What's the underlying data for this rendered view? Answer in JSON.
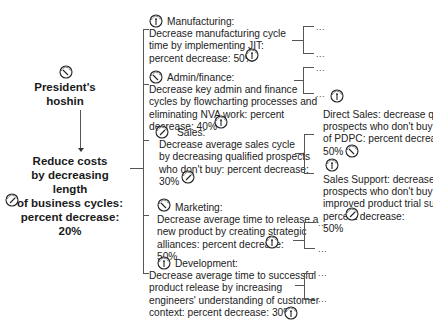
{
  "root": {
    "title": "President's hoshin",
    "title_line1": "President's",
    "title_line2": "hoshin",
    "goal_lines": [
      "Reduce costs",
      "by decreasing length",
      "of business cycles:",
      "percent decrease:",
      "20%"
    ]
  },
  "departments": [
    {
      "name": "Manufacturing:",
      "lines": [
        "Decrease manufacturing cycle",
        "time by implementing JIT:",
        "percent decrease: 50%"
      ]
    },
    {
      "name": "Admin/finance:",
      "lines": [
        "Decrease key admin and finance",
        "cycles by flowcharting processes and",
        "eliminating NVA work: percent",
        "decrease: 40%"
      ]
    },
    {
      "name": "Sales:",
      "lines": [
        "Decrease average sales cycle",
        "by decreasing qualified prospects",
        "who don't buy: percent decrease:",
        "30%"
      ]
    },
    {
      "name": "Marketing:",
      "lines": [
        "Decrease average time to release a",
        "new product by creating strategic",
        "alliances: percent decrease:",
        "50%"
      ]
    },
    {
      "name": "Development:",
      "lines": [
        "Decrease average time to successful",
        "product release by increasing",
        "engineers' understanding of customer",
        "context: percent decrease: 30%"
      ]
    }
  ],
  "sub_items": {
    "ellipsis": "...",
    "direct_sales": {
      "lines": [
        "Direct Sales: decrease qualifi",
        "prospects who don't buy by u",
        "of PDPC: percent decrease:",
        "50%"
      ]
    },
    "sales_support": {
      "lines": [
        "Sales Support: decrease qua",
        "prospects who don't buy by",
        "improved product trial suppor",
        "percent decrease:",
        "50%"
      ]
    }
  }
}
